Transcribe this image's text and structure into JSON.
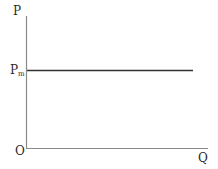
{
  "diagram": {
    "title": "",
    "axes": {
      "y_label": "P",
      "x_label": "Q",
      "origin_label": "O"
    },
    "lines": [
      {
        "name": "price-level-line",
        "label": "P",
        "label_sub": "m",
        "type": "horizontal"
      }
    ],
    "colors": {
      "axis": "#888888",
      "line": "#333333",
      "text": "#2a2a2a"
    }
  }
}
